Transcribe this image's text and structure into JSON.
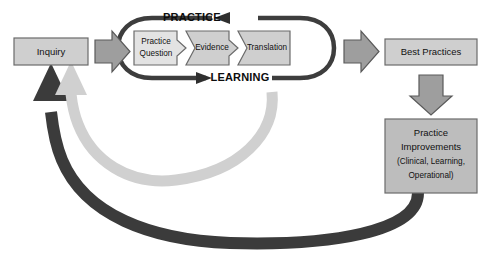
{
  "diagram": {
    "type": "cycle-flow",
    "colors": {
      "box_fill_light": "#e3e3e3",
      "box_fill_mid": "#cfcfcf",
      "box_fill_dark": "#bdbdbd",
      "box_stroke": "#6b6b6b",
      "block_arrow_fill": "#9e9e9e",
      "block_arrow_stroke": "#5a5a5a",
      "track_stroke": "#3d3d3d",
      "feedback_dark": "#3b3b3b",
      "feedback_light": "#d0d0d0",
      "text": "#111111",
      "background": "#ffffff"
    },
    "nodes": {
      "inquiry": {
        "label": "Inquiry"
      },
      "practice_question": {
        "label_line1": "Practice",
        "label_line2": "Question"
      },
      "evidence": {
        "label": "Evidence"
      },
      "translation": {
        "label": "Translation"
      },
      "best_practices": {
        "label": "Best Practices"
      },
      "practice_improvements": {
        "label_line1": "Practice",
        "label_line2": "Improvements",
        "label_line3": "(Clinical, Learning,",
        "label_line4": "Operational)"
      }
    },
    "tracks": {
      "practice": {
        "label": "PRACTICE",
        "direction": "left"
      },
      "learning": {
        "label": "LEARNING",
        "direction": "right"
      }
    },
    "connectors": {
      "inquiry_to_cycle": {
        "shape": "block-arrow",
        "direction": "right"
      },
      "cycle_to_best_practices": {
        "shape": "block-arrow",
        "direction": "right"
      },
      "best_practices_to_improvements": {
        "shape": "block-arrow",
        "direction": "down"
      },
      "improvements_to_inquiry": {
        "shape": "curved-arrow",
        "direction": "up-left",
        "tone": "dark"
      },
      "learning_to_inquiry": {
        "shape": "curved-arrow",
        "direction": "up-left",
        "tone": "light"
      }
    }
  }
}
